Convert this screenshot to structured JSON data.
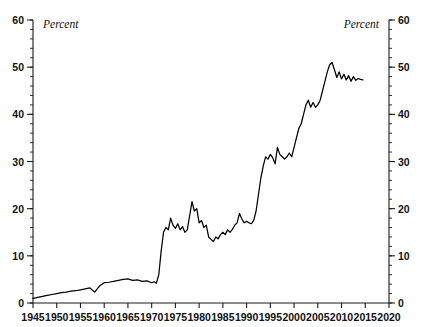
{
  "chart_data": {
    "type": "line",
    "title": "",
    "subtitle": "",
    "xlabel": "",
    "ylabel": "Percent",
    "ylabel_right": "Percent",
    "unit_label_left": "Percent",
    "unit_label_right": "Percent",
    "grid": false,
    "legend": "none",
    "xlim": [
      1945,
      2020
    ],
    "ylim": [
      0,
      60
    ],
    "y_ticks": [
      0,
      10,
      20,
      30,
      40,
      50,
      60
    ],
    "y_tick_labels": [
      "0",
      "10",
      "20",
      "30",
      "40",
      "50",
      "60"
    ],
    "y_minor_step": 2,
    "x_ticks": [
      1945,
      1950,
      1955,
      1960,
      1965,
      1970,
      1975,
      1980,
      1985,
      1990,
      1995,
      2000,
      2005,
      2010,
      2015,
      2020
    ],
    "x_tick_labels": [
      "1945",
      "1950",
      "1955",
      "1960",
      "1965",
      "1970",
      "1975",
      "1980",
      "1985",
      "1990",
      "1995",
      "2000",
      "2005",
      "2010",
      "2015",
      "2020"
    ],
    "right_axis_ticks": [
      0,
      10,
      20,
      30,
      40,
      50,
      60
    ],
    "right_axis_tick_labels": [
      "0",
      "10",
      "20",
      "30",
      "40",
      "50",
      "60"
    ],
    "series": [
      {
        "name": "Percent",
        "color": "#000000",
        "x": [
          1945,
          1946,
          1947,
          1948,
          1949,
          1950,
          1951,
          1952,
          1953,
          1954,
          1955,
          1956,
          1957,
          1958,
          1959,
          1960,
          1961,
          1962,
          1963,
          1964,
          1965,
          1966,
          1967,
          1968,
          1969,
          1970,
          1970.5,
          1971,
          1971.5,
          1972,
          1972.5,
          1973,
          1973.5,
          1974,
          1974.5,
          1975,
          1975.5,
          1976,
          1976.5,
          1977,
          1977.5,
          1978,
          1978.5,
          1979,
          1979.5,
          1980,
          1980.5,
          1981,
          1981.5,
          1982,
          1982.5,
          1983,
          1983.5,
          1984,
          1984.5,
          1985,
          1985.5,
          1986,
          1986.5,
          1987,
          1987.5,
          1988,
          1988.5,
          1989,
          1989.5,
          1990,
          1990.5,
          1991,
          1991.5,
          1992,
          1992.5,
          1993,
          1993.5,
          1994,
          1994.5,
          1995,
          1995.5,
          1996,
          1996.5,
          1997,
          1997.5,
          1998,
          1998.5,
          1999,
          1999.5,
          2000,
          2000.5,
          2001,
          2001.5,
          2002,
          2002.5,
          2003,
          2003.5,
          2004,
          2004.5,
          2005,
          2005.5,
          2006,
          2006.5,
          2007,
          2007.5,
          2008,
          2008.5,
          2009,
          2009.5,
          2010,
          2010.5,
          2011,
          2011.5,
          2012,
          2012.5,
          2013,
          2013.5,
          2014,
          2014.5
        ],
        "y": [
          1.0,
          1.2,
          1.4,
          1.6,
          1.8,
          2.0,
          2.2,
          2.3,
          2.5,
          2.6,
          2.8,
          3.0,
          3.2,
          2.3,
          3.6,
          4.3,
          4.4,
          4.6,
          4.8,
          5.0,
          5.1,
          4.8,
          4.9,
          4.6,
          4.7,
          4.3,
          4.5,
          4.2,
          6.0,
          11.0,
          15.0,
          16.0,
          15.5,
          18.0,
          16.5,
          15.8,
          16.8,
          15.5,
          16.2,
          15.0,
          15.5,
          18.5,
          21.5,
          19.5,
          20.0,
          17.0,
          17.5,
          16.0,
          16.5,
          14.0,
          13.5,
          13.0,
          14.0,
          13.6,
          14.5,
          15.0,
          14.5,
          15.5,
          15.0,
          15.6,
          16.5,
          17.0,
          19.0,
          17.8,
          17.0,
          17.3,
          17.0,
          16.8,
          17.5,
          19.5,
          23.0,
          26.5,
          29.0,
          31.0,
          30.5,
          31.5,
          30.8,
          29.5,
          33.0,
          31.5,
          31.0,
          30.5,
          31.0,
          31.8,
          31.0,
          33.0,
          35.0,
          37.0,
          38.0,
          40.0,
          42.0,
          43.0,
          41.5,
          42.5,
          41.5,
          42.0,
          43.0,
          45.0,
          47.0,
          49.0,
          50.5,
          51.0,
          49.5,
          47.8,
          49.0,
          47.5,
          48.5,
          47.3,
          48.2,
          47.0,
          48.0,
          47.2,
          47.6,
          47.4,
          47.3
        ]
      }
    ]
  },
  "axes": {
    "left": {
      "unit": "Percent"
    },
    "right": {
      "unit": "Percent"
    }
  }
}
